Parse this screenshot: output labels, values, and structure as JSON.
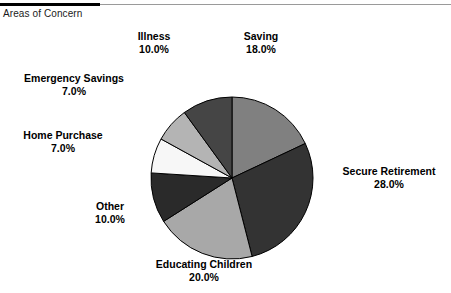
{
  "header": {
    "title": "Areas of Concern"
  },
  "chart_data": {
    "type": "pie",
    "title": "Areas of Concern",
    "start_angle_deg": 0,
    "direction": "clockwise",
    "legend_position": "none",
    "labels_outside": true,
    "categories": [
      "Saving",
      "Secure Retirement",
      "Educating Children",
      "Other",
      "Home Purchase",
      "Emergency Savings",
      "Illness"
    ],
    "values": [
      18.0,
      28.0,
      20.0,
      10.0,
      7.0,
      7.0,
      10.0
    ],
    "value_labels": [
      "18.0%",
      "28.0%",
      "20.0%",
      "10.0%",
      "7.0%",
      "7.0%",
      "10.0%"
    ],
    "colors": [
      "#808080",
      "#333333",
      "#a8a8a8",
      "#2a2a2a",
      "#f7f7f7",
      "#b4b4b4",
      "#454545"
    ],
    "slices": [
      {
        "name": "Saving",
        "value": 18.0,
        "value_label": "18.0%",
        "color": "#808080"
      },
      {
        "name": "Secure Retirement",
        "value": 28.0,
        "value_label": "28.0%",
        "color": "#333333"
      },
      {
        "name": "Educating Children",
        "value": 20.0,
        "value_label": "20.0%",
        "color": "#a8a8a8"
      },
      {
        "name": "Other",
        "value": 10.0,
        "value_label": "10.0%",
        "color": "#2a2a2a"
      },
      {
        "name": "Home Purchase",
        "value": 7.0,
        "value_label": "7.0%",
        "color": "#f7f7f7"
      },
      {
        "name": "Emergency Savings",
        "value": 7.0,
        "value_label": "7.0%",
        "color": "#b4b4b4"
      },
      {
        "name": "Illness",
        "value": 10.0,
        "value_label": "10.0%",
        "color": "#454545"
      }
    ],
    "total": 100.0,
    "units": "percent",
    "xlabel": "",
    "ylabel": ""
  },
  "style": {
    "slice_outline": "#000000",
    "background": "#ffffff",
    "text_color": "#000000",
    "rule_dark": "#000000",
    "rule_light": "#9a9a9a"
  }
}
